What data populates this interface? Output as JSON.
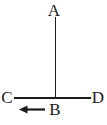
{
  "figure": {
    "points": {
      "a": {
        "label": "A"
      },
      "b": {
        "label": "B"
      },
      "c": {
        "label": "C"
      },
      "d": {
        "label": "D"
      }
    },
    "colors": {
      "stroke": "#1b1b1b",
      "text": "#1b1b1b",
      "background": "#ffffff"
    }
  }
}
